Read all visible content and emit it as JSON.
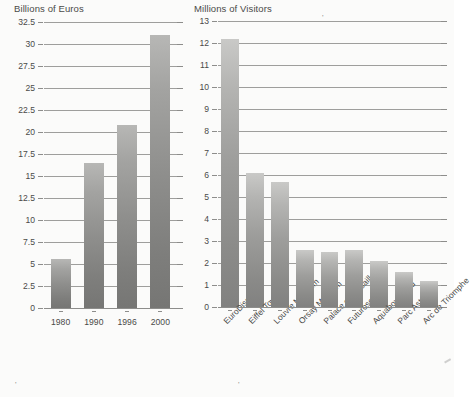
{
  "chart_data": [
    {
      "type": "bar",
      "title": "Billions of Euros",
      "xlabel": "",
      "ylabel": "Billions of Euros",
      "categories": [
        "1980",
        "1990",
        "1996",
        "2000"
      ],
      "values": [
        5.6,
        16.5,
        20.8,
        31.0
      ],
      "ylim": [
        0,
        32.5
      ],
      "yticks": [
        "0",
        "2.5",
        "5",
        "7.5",
        "10",
        "12.5",
        "15",
        "17.5",
        "20",
        "22.5",
        "25",
        "27.5",
        "30",
        "32.5"
      ],
      "ytick_values": [
        0,
        2.5,
        5,
        7.5,
        10,
        12.5,
        15,
        17.5,
        20,
        22.5,
        25,
        27.5,
        30,
        32.5
      ],
      "grid": true,
      "legend": "none"
    },
    {
      "type": "bar",
      "title": "Millions of Visitors",
      "xlabel": "",
      "ylabel": "Millions of Visitors",
      "categories": [
        "EuroDisney",
        "Eiffel Tower",
        "Louvre Museum",
        "Orsay Museum",
        "Palace of Versailles",
        "Futuroscope",
        "Aquaboulevard",
        "Parc Asterix",
        "Arc de Triomphe"
      ],
      "values": [
        12.2,
        6.1,
        5.7,
        2.6,
        2.5,
        2.6,
        2.1,
        1.6,
        1.2
      ],
      "ylim": [
        0,
        13
      ],
      "yticks": [
        "0",
        "1",
        "2",
        "3",
        "4",
        "5",
        "6",
        "7",
        "8",
        "9",
        "10",
        "11",
        "12",
        "13"
      ],
      "ytick_values": [
        0,
        1,
        2,
        3,
        4,
        5,
        6,
        7,
        8,
        9,
        10,
        11,
        12,
        13
      ],
      "grid": true,
      "legend": "none"
    }
  ],
  "colors": {
    "bar_top": "#c9c9c7",
    "bar_bottom": "#818180",
    "axis": "#8d8d8b",
    "text": "#4a4a48",
    "background": "#fbfbfa"
  },
  "artifacts": {
    "top_mark": "'",
    "bottom_left_mark": "'",
    "bottom_mid_mark": "'"
  }
}
